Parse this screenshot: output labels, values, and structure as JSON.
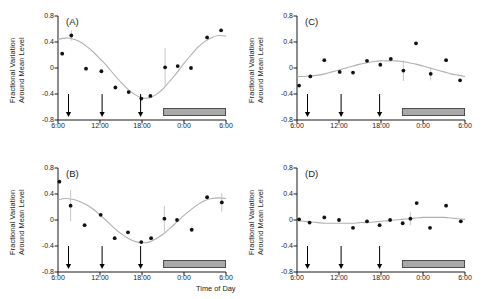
{
  "figure": {
    "xlabel": "Time of Day",
    "ylabel_line1": "Fractional Variation",
    "ylabel_line2": "Around Mean Level",
    "yticks": [
      "0.8",
      "0.4",
      "0",
      "-0.4",
      "-0.8"
    ],
    "ytick_values": [
      0.8,
      0.4,
      0,
      -0.4,
      -0.8
    ],
    "xticks": [
      "6:00",
      "12:00",
      "18:00",
      "0:00",
      "6:00"
    ],
    "xtick_values": [
      6,
      12,
      18,
      24,
      30
    ],
    "marker_color": "#111111",
    "fit_color": "#b0b0b0",
    "errorbar_color": "#c0c0c0",
    "night_bar_color": "#a9a9a9",
    "arrow_color": "#000000",
    "arrow_times": [
      7.5,
      12.3,
      17.8
    ],
    "night_bar_start": 21,
    "night_bar_end": 30
  },
  "chart_data": [
    {
      "type": "scatter",
      "panel": "(A)",
      "title": "",
      "xlabel": "",
      "ylabel": "Fractional Variation Around Mean Level",
      "xlim": [
        6,
        30
      ],
      "ylim": [
        -0.8,
        0.8
      ],
      "grid": false,
      "legend": "none",
      "x": [
        6.6,
        7.9,
        10.0,
        12.2,
        14.2,
        16.1,
        17.9,
        19.2,
        21.3,
        23.1,
        25.0,
        27.3,
        29.3
      ],
      "y": [
        0.22,
        0.5,
        -0.01,
        -0.05,
        -0.3,
        -0.37,
        -0.47,
        -0.43,
        0.01,
        0.03,
        0.0,
        0.47,
        0.58
      ],
      "yerr": [
        0.0,
        0.08,
        0.0,
        0.0,
        0.0,
        0.0,
        0.0,
        0.0,
        0.3,
        0.0,
        0.0,
        0.0,
        0.0
      ],
      "fit_x": [
        6.0,
        7.0,
        8.0,
        9.0,
        10.0,
        11.0,
        12.0,
        13.0,
        14.0,
        15.0,
        16.0,
        17.0,
        18.0,
        19.0,
        20.0,
        21.0,
        22.0,
        23.0,
        24.0,
        25.0,
        26.0,
        27.0,
        28.0,
        29.0,
        30.0
      ],
      "fit_y": [
        0.44,
        0.46,
        0.45,
        0.41,
        0.34,
        0.25,
        0.14,
        0.03,
        -0.1,
        -0.22,
        -0.33,
        -0.41,
        -0.46,
        -0.46,
        -0.41,
        -0.32,
        -0.2,
        -0.07,
        0.07,
        0.2,
        0.32,
        0.41,
        0.47,
        0.5,
        0.49
      ]
    },
    {
      "type": "scatter",
      "panel": "(B)",
      "title": "",
      "xlabel": "",
      "ylabel": "Fractional Variation Around Mean Level",
      "xlim": [
        6,
        30
      ],
      "ylim": [
        -0.8,
        0.8
      ],
      "grid": false,
      "legend": "none",
      "x": [
        6.2,
        7.8,
        9.8,
        12.1,
        14.1,
        16.0,
        17.9,
        19.3,
        21.2,
        23.0,
        25.1,
        27.3,
        29.4
      ],
      "y": [
        0.59,
        0.22,
        -0.08,
        0.08,
        -0.28,
        -0.19,
        -0.34,
        -0.28,
        0.02,
        0.0,
        -0.15,
        0.35,
        0.27
      ],
      "yerr": [
        0.0,
        0.24,
        0.0,
        0.0,
        0.0,
        0.0,
        0.0,
        0.0,
        0.2,
        0.0,
        0.0,
        0.0,
        0.14
      ],
      "fit_x": [
        6.0,
        7.0,
        8.0,
        9.0,
        10.0,
        11.0,
        12.0,
        13.0,
        14.0,
        15.0,
        16.0,
        17.0,
        18.0,
        19.0,
        20.0,
        21.0,
        22.0,
        23.0,
        24.0,
        25.0,
        26.0,
        27.0,
        28.0,
        29.0,
        30.0
      ],
      "fit_y": [
        0.31,
        0.33,
        0.32,
        0.29,
        0.24,
        0.17,
        0.08,
        -0.02,
        -0.12,
        -0.21,
        -0.28,
        -0.33,
        -0.35,
        -0.34,
        -0.29,
        -0.22,
        -0.13,
        -0.03,
        0.07,
        0.16,
        0.24,
        0.3,
        0.33,
        0.34,
        0.33
      ]
    },
    {
      "type": "scatter",
      "panel": "(C)",
      "title": "",
      "xlabel": "",
      "ylabel": "Fractional Variation Around Mean Level",
      "xlim": [
        6,
        30
      ],
      "ylim": [
        -0.8,
        0.8
      ],
      "grid": false,
      "legend": "none",
      "x": [
        6.3,
        7.9,
        9.9,
        12.1,
        14.0,
        16.0,
        17.9,
        19.4,
        21.2,
        23.0,
        25.1,
        27.3,
        29.3
      ],
      "y": [
        -0.27,
        -0.13,
        0.12,
        -0.06,
        -0.07,
        0.11,
        0.05,
        0.14,
        -0.04,
        0.38,
        -0.09,
        0.12,
        -0.19
      ],
      "yerr": [
        0.0,
        0.0,
        0.0,
        0.0,
        0.0,
        0.0,
        0.0,
        0.0,
        0.16,
        0.0,
        0.1,
        0.0,
        0.0
      ],
      "fit_x": [
        6.0,
        7.0,
        8.0,
        9.0,
        10.0,
        11.0,
        12.0,
        13.0,
        14.0,
        15.0,
        16.0,
        17.0,
        18.0,
        19.0,
        20.0,
        21.0,
        22.0,
        23.0,
        24.0,
        25.0,
        26.0,
        27.0,
        28.0,
        29.0,
        30.0
      ],
      "fit_y": [
        -0.13,
        -0.13,
        -0.12,
        -0.11,
        -0.09,
        -0.06,
        -0.03,
        0.0,
        0.03,
        0.06,
        0.08,
        0.1,
        0.11,
        0.11,
        0.11,
        0.1,
        0.08,
        0.06,
        0.03,
        0.0,
        -0.03,
        -0.06,
        -0.09,
        -0.11,
        -0.13
      ]
    },
    {
      "type": "scatter",
      "panel": "(D)",
      "title": "",
      "xlabel": "Time of Day",
      "ylabel": "Fractional Variation Around Mean Level",
      "xlim": [
        6,
        30
      ],
      "ylim": [
        -0.8,
        0.8
      ],
      "grid": false,
      "legend": "none",
      "x": [
        6.3,
        7.8,
        9.9,
        12.0,
        14.0,
        16.0,
        17.8,
        19.3,
        21.1,
        22.2,
        23.1,
        25.0,
        27.3,
        29.4
      ],
      "y": [
        0.01,
        -0.04,
        0.04,
        0.0,
        -0.12,
        -0.02,
        -0.08,
        0.0,
        -0.05,
        0.02,
        0.26,
        -0.12,
        0.22,
        -0.02
      ],
      "yerr": [
        0.0,
        0.0,
        0.0,
        0.0,
        0.0,
        0.0,
        0.0,
        0.0,
        0.0,
        0.1,
        0.0,
        0.0,
        0.0,
        0.0
      ],
      "fit_x": [
        6.0,
        7.0,
        8.0,
        9.0,
        10.0,
        11.0,
        12.0,
        13.0,
        14.0,
        15.0,
        16.0,
        17.0,
        18.0,
        19.0,
        20.0,
        21.0,
        22.0,
        23.0,
        24.0,
        25.0,
        26.0,
        27.0,
        28.0,
        29.0,
        30.0
      ],
      "fit_y": [
        -0.01,
        -0.02,
        -0.03,
        -0.04,
        -0.05,
        -0.05,
        -0.05,
        -0.05,
        -0.05,
        -0.04,
        -0.04,
        -0.03,
        -0.02,
        -0.01,
        0.0,
        0.01,
        0.02,
        0.03,
        0.04,
        0.04,
        0.04,
        0.04,
        0.03,
        0.02,
        0.01
      ]
    }
  ]
}
